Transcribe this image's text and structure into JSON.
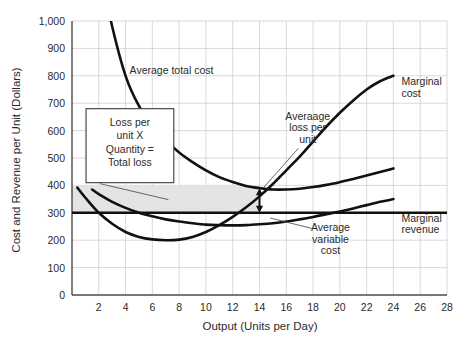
{
  "chart_data": {
    "type": "line",
    "title": "",
    "xlabel": "Output (Units per Day)",
    "ylabel": "Cost and Revenue per Unit (Dollars)",
    "xlim": [
      0,
      28
    ],
    "ylim": [
      0,
      1000
    ],
    "grid": true,
    "legend_position": "inline-annotations",
    "xticks": [
      "2",
      "4",
      "6",
      "8",
      "10",
      "12",
      "14",
      "16",
      "18",
      "20",
      "22",
      "24",
      "26",
      "28"
    ],
    "xtick_values": [
      2,
      4,
      6,
      8,
      10,
      12,
      14,
      16,
      18,
      20,
      22,
      24,
      26,
      28
    ],
    "yticks": [
      "0",
      "100",
      "200",
      "300",
      "400",
      "500",
      "600",
      "700",
      "800",
      "900",
      "1,000"
    ],
    "ytick_values": [
      0,
      100,
      200,
      300,
      400,
      500,
      600,
      700,
      800,
      900,
      1000
    ],
    "series": [
      {
        "name": "Average total cost",
        "x": [
          2.6,
          3,
          4,
          5,
          6,
          7,
          8,
          9,
          10,
          11,
          12,
          13,
          14,
          15,
          16,
          17,
          18,
          19,
          20,
          21,
          22,
          23,
          24
        ],
        "values": [
          1090,
          980,
          800,
          690,
          620,
          565,
          520,
          485,
          455,
          430,
          412,
          398,
          390,
          385,
          385,
          388,
          394,
          402,
          412,
          423,
          436,
          449,
          462
        ]
      },
      {
        "name": "Average variable cost",
        "x": [
          1.5,
          2,
          3,
          4,
          5,
          6,
          7,
          8,
          9,
          10,
          11,
          12,
          13,
          14,
          15,
          16,
          17,
          18,
          19,
          20,
          21,
          22,
          23,
          24
        ],
        "values": [
          385,
          368,
          340,
          318,
          300,
          287,
          276,
          268,
          262,
          257,
          255,
          254,
          255,
          258,
          262,
          268,
          276,
          285,
          295,
          305,
          316,
          328,
          340,
          350
        ]
      },
      {
        "name": "Marginal cost",
        "x": [
          0.4,
          1,
          2,
          3,
          4,
          5,
          6,
          7,
          8,
          9,
          10,
          11,
          12,
          13,
          14,
          15,
          16,
          17,
          18,
          19,
          20,
          21,
          22,
          23,
          24
        ],
        "values": [
          392,
          355,
          300,
          260,
          230,
          212,
          203,
          200,
          202,
          212,
          230,
          255,
          285,
          320,
          360,
          405,
          455,
          505,
          560,
          615,
          665,
          710,
          750,
          780,
          800
        ]
      },
      {
        "name": "Marginal revenue",
        "x": [
          0,
          28
        ],
        "values": [
          300,
          300
        ]
      }
    ],
    "annotations": [
      {
        "name": "average-total-cost-label",
        "text": "Average total cost",
        "x": 5.0,
        "y": 815
      },
      {
        "name": "marginal-cost-label",
        "text": "Marginal cost",
        "x": 25.2,
        "y": 760
      },
      {
        "name": "averaage-loss-per-unit-label",
        "text": "Averaage loss per unit",
        "x": 17.3,
        "y": 630
      },
      {
        "name": "average-variable-cost-label",
        "text": "Average variable cost",
        "x": 19.0,
        "y": 230
      },
      {
        "name": "marginal-revenue-label",
        "text": "Marginal revenue",
        "x": 25.2,
        "y": 265
      },
      {
        "name": "loss-callout-box",
        "text": "Loss per unit X Quantity = Total loss",
        "x": 3.0,
        "y": 560
      }
    ],
    "shaded_region": {
      "name": "total-loss-area",
      "label": "Total loss rectangle",
      "x_range": [
        0,
        14
      ],
      "y_range": [
        300,
        400
      ],
      "color": "#e4e4e4"
    },
    "loss_arrow": {
      "name": "average-loss-per-unit-arrow",
      "x": 14,
      "y_from": 300,
      "y_to": 390
    }
  },
  "labels": {
    "marginal_cost_line1": "Marginal",
    "marginal_cost_line2": "cost",
    "marginal_revenue_line1": "Marginal",
    "marginal_revenue_line2": "revenue",
    "avg_total_cost": "Average total cost",
    "avg_loss_line1": "Averaage",
    "avg_loss_line2": "loss per",
    "avg_loss_line3": "unit",
    "avg_var_cost_line1": "Average",
    "avg_var_cost_line2": "variable",
    "avg_var_cost_line3": "cost",
    "box_line1": "Loss per",
    "box_line2": "unit X",
    "box_line3": "Quantity =",
    "box_line4": "Total loss"
  },
  "colors": {
    "curve": "#111111",
    "grid": "#c9c9c9",
    "axis": "#4a4a4a",
    "shade": "#e4e4e4",
    "background": "#ffffff"
  }
}
